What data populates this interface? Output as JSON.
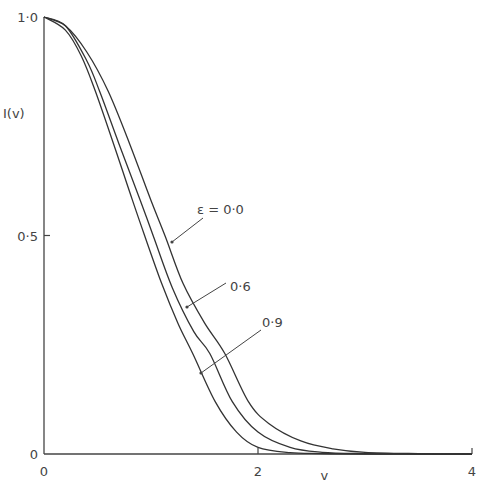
{
  "chart_data": {
    "type": "line",
    "title": "",
    "xlabel": "v",
    "ylabel": "I(v)",
    "xlim": [
      0,
      4
    ],
    "ylim": [
      0,
      1.0
    ],
    "grid": false,
    "x_ticks": [
      {
        "value": 0,
        "label": "0"
      },
      {
        "value": 2,
        "label": "2"
      },
      {
        "value": 4,
        "label": "4"
      }
    ],
    "y_ticks": [
      {
        "value": 0,
        "label": "0"
      },
      {
        "value": 0.5,
        "label": "0·5"
      },
      {
        "value": 1.0,
        "label": "1·0"
      }
    ],
    "series": [
      {
        "name": "ε = 0·0",
        "label": "ε = 0·0",
        "x": [
          0,
          0.2,
          0.4,
          0.6,
          0.8,
          1.0,
          1.13,
          1.3,
          1.5,
          1.69,
          1.91,
          2.1,
          2.4,
          2.7,
          3.0,
          3.5,
          4.0
        ],
        "y": [
          1.0,
          0.98,
          0.92,
          0.83,
          0.71,
          0.58,
          0.5,
          0.39,
          0.3,
          0.23,
          0.12,
          0.07,
          0.03,
          0.012,
          0.004,
          0.001,
          0.0
        ]
      },
      {
        "name": "0·6",
        "label": "0·6",
        "x": [
          0,
          0.2,
          0.4,
          0.52,
          0.7,
          0.9,
          1.02,
          1.2,
          1.4,
          1.55,
          1.76,
          2.0,
          2.3,
          2.6,
          3.0,
          3.5,
          4.0
        ],
        "y": [
          1.0,
          0.98,
          0.9,
          0.83,
          0.71,
          0.58,
          0.5,
          0.38,
          0.28,
          0.23,
          0.12,
          0.05,
          0.015,
          0.004,
          0.001,
          0.0,
          0.0
        ]
      },
      {
        "name": "0·9",
        "label": "0·9",
        "x": [
          0,
          0.2,
          0.35,
          0.48,
          0.65,
          0.8,
          0.94,
          1.1,
          1.25,
          1.39,
          1.6,
          1.8,
          2.0,
          2.3,
          2.6,
          3.0,
          4.0
        ],
        "y": [
          1.0,
          0.97,
          0.91,
          0.83,
          0.71,
          0.6,
          0.5,
          0.39,
          0.3,
          0.23,
          0.12,
          0.05,
          0.015,
          0.003,
          0.001,
          0.0,
          0.0
        ]
      }
    ],
    "annotations": [
      {
        "text": "ε = 0·0",
        "target_series": 0
      },
      {
        "text": "0·6",
        "target_series": 1
      },
      {
        "text": "0·9",
        "target_series": 2
      }
    ]
  },
  "colors": {
    "line": "#333333",
    "axis": "#444444",
    "background": "#ffffff"
  }
}
